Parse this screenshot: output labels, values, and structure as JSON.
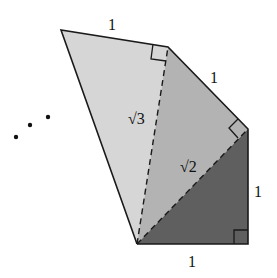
{
  "diagram": {
    "colors": {
      "triangle_1": "#5f5f5f",
      "triangle_2": "#b3b3b3",
      "triangle_3": "#d6d6d6",
      "stroke": "#1a1a1a"
    },
    "labels": {
      "bottom_leg": "1",
      "right_leg": "1",
      "upper_right_leg": "1",
      "top_leg": "1",
      "hyp_sqrt2": "√2",
      "hyp_sqrt3": "√3",
      "continuation": "• • •"
    }
  }
}
